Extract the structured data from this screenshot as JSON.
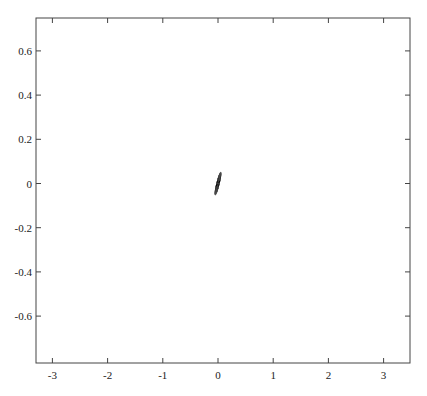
{
  "chart_data": {
    "type": "line",
    "title": "",
    "subtitle": "",
    "xlabel": "",
    "ylabel": "",
    "xlim": [
      -3.3,
      3.5
    ],
    "ylim": [
      -0.76,
      0.76
    ],
    "grid": false,
    "legend": null,
    "x_ticks": [
      -3,
      -2,
      -1,
      0,
      1,
      2,
      3
    ],
    "x_tick_labels": [
      "-3",
      "-2",
      "-1",
      "0",
      "1",
      "2",
      "3"
    ],
    "y_ticks": [
      0.6,
      0.4,
      0.2,
      0,
      -0.2,
      -0.4,
      -0.6
    ],
    "y_tick_labels": [
      "0.6",
      "0.4",
      "0.2",
      "0",
      "-0.2",
      "-0.4",
      "-0.6"
    ],
    "series": [
      {
        "name": "trajectory",
        "color": "#555555",
        "generator": "chua",
        "params": {
          "alpha": 9.0,
          "beta": 14.286,
          "m0": -0.142857,
          "m1": 0.285714
        },
        "initial": [
          0.7,
          0.0,
          0.0
        ],
        "dt": 0.01,
        "transient_steps": 2000,
        "steps": 26000,
        "scroll_centers": [
          {
            "x": -1.9,
            "y": 0.0
          },
          {
            "x": 1.95,
            "y": 0.0
          }
        ]
      }
    ]
  },
  "axes": {
    "frame": {
      "left": 36,
      "right": 410,
      "top": 18,
      "bottom": 363
    },
    "x_map": {
      "origin_px": 218,
      "px_per_unit": 55.2
    },
    "y_map": {
      "origin_px": 183.5,
      "px_per_unit": 221
    }
  },
  "colors": {
    "line": "#555555",
    "axis": "#444444",
    "background": "#ffffff"
  }
}
